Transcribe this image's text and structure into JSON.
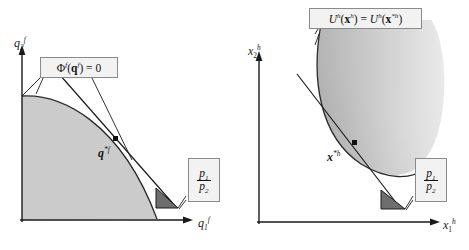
{
  "figure": {
    "type": "economics-diagram-pair",
    "background": "#ffffff",
    "panels": [
      {
        "id": "producer",
        "name": "profit-maximization",
        "axes": {
          "x_label": "q₁ᶠ",
          "y_label": "q₂ᶠ",
          "x_label_parts": {
            "base": "q",
            "sub": "1",
            "sup": "f"
          },
          "y_label_parts": {
            "base": "q",
            "sub": "2",
            "sup": "f"
          },
          "color": "#1a1a1a"
        },
        "region": {
          "name": "production-possibility-set",
          "fill": "#cbcbcb",
          "stroke": "#2a2a2a",
          "shape": "concave-frontier-quarter"
        },
        "frontier_label": {
          "text": "Φᶠ(qᶠ) = 0",
          "parts": {
            "phi": "Φ",
            "phi_sup": "f",
            "arg": "q",
            "arg_sup": "f",
            "eq": "= 0"
          },
          "box_fill": "#f2f2f2",
          "box_stroke": "#8a8a8a",
          "leader_count": 3
        },
        "optimum": {
          "label": "q*ᶠ",
          "parts": {
            "base": "q",
            "sup": "*f"
          },
          "marker": "square",
          "marker_color": "#111111"
        },
        "price_box": {
          "numerator": "p₁",
          "denominator": "p₂",
          "num_parts": {
            "base": "p",
            "sub": "1"
          },
          "den_parts": {
            "base": "p",
            "sub": "2"
          },
          "box_fill": "#f2f2f2",
          "box_stroke": "#8a8a8a",
          "leader_count": 2
        },
        "slope_triangle": {
          "name": "price-ratio-triangle",
          "fill": "#6e6e6e",
          "stroke": "#1a1a1a"
        },
        "tangent_line": {
          "name": "iso-profit-line",
          "stroke": "#1a1a1a"
        }
      },
      {
        "id": "consumer",
        "name": "utility-maximization",
        "axes": {
          "x_label": "x₁ʰ",
          "y_label": "x₂ʰ",
          "x_label_parts": {
            "base": "x",
            "sub": "1",
            "sup": "h"
          },
          "y_label_parts": {
            "base": "x",
            "sub": "2",
            "sup": "h"
          },
          "color": "#1a1a1a"
        },
        "region": {
          "name": "upper-contour-set",
          "fill_start": "#9a9a9a",
          "fill_end": "#ffffff",
          "stroke": "#2a2a2a",
          "shape": "convex-indifference-region"
        },
        "curve_label": {
          "text": "Uʰ(xʰ) = Uʰ(x*ʰ)",
          "parts": {
            "u": "U",
            "u_sup": "h",
            "x": "x",
            "x_sup": "h",
            "eq": "=",
            "x2_sup": "*h"
          },
          "box_fill": "#f2f2f2",
          "box_stroke": "#8a8a8a",
          "leader_count": 2
        },
        "optimum": {
          "label": "x*ʰ",
          "parts": {
            "base": "x",
            "sup": "*h"
          },
          "marker": "square",
          "marker_color": "#111111"
        },
        "price_box": {
          "numerator": "p₁",
          "denominator": "p₂",
          "num_parts": {
            "base": "p",
            "sub": "1"
          },
          "den_parts": {
            "base": "p",
            "sub": "2"
          },
          "box_fill": "#f2f2f2",
          "box_stroke": "#8a8a8a",
          "leader_count": 2
        },
        "slope_triangle": {
          "name": "price-ratio-triangle",
          "fill": "#6e6e6e",
          "stroke": "#1a1a1a"
        },
        "tangent_line": {
          "name": "budget-line",
          "stroke": "#1a1a1a"
        }
      }
    ]
  }
}
